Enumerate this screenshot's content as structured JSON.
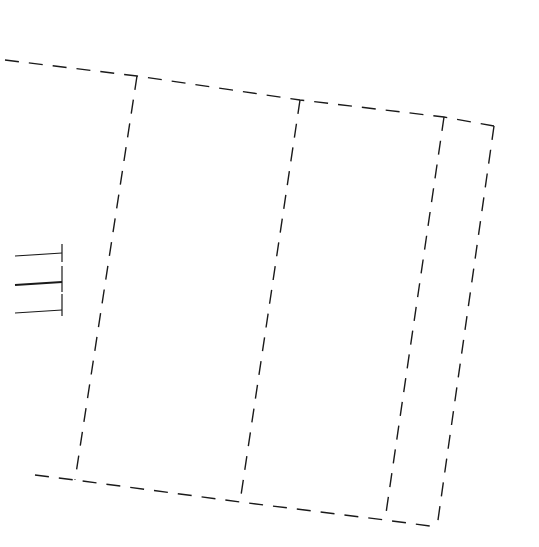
{
  "diagram": {
    "stroke_color": "#1a1a1a",
    "background": "#ffffff",
    "dash": "14 10",
    "top_edge": [
      [
        5,
        60
      ],
      [
        137,
        76
      ],
      [
        300,
        100
      ],
      [
        444,
        117
      ],
      [
        494,
        126
      ]
    ],
    "bottom_edge": [
      [
        35,
        475
      ],
      [
        75,
        480
      ],
      [
        240,
        502
      ],
      [
        385,
        520
      ],
      [
        437,
        527
      ]
    ],
    "columns": [
      {
        "name": "column-1",
        "top": [
          137,
          76
        ],
        "bottom": [
          75,
          480
        ]
      },
      {
        "name": "column-2",
        "top": [
          300,
          100
        ],
        "bottom": [
          240,
          502
        ]
      },
      {
        "name": "column-3",
        "top": [
          444,
          117
        ],
        "bottom": [
          385,
          520
        ]
      },
      {
        "name": "column-4",
        "top": [
          494,
          126
        ],
        "bottom": [
          437,
          527
        ]
      }
    ],
    "ticks": [
      {
        "x1": 15,
        "y1": 256,
        "x2": 62,
        "y2": 253,
        "cap_top": 244,
        "cap_bottom": 262
      },
      {
        "x1": 15,
        "y1": 285,
        "x2": 62,
        "y2": 282,
        "cap_top": 266,
        "cap_bottom": 292,
        "bold": true
      },
      {
        "x1": 15,
        "y1": 313,
        "x2": 62,
        "y2": 310,
        "cap_top": 294,
        "cap_bottom": 316
      }
    ]
  }
}
